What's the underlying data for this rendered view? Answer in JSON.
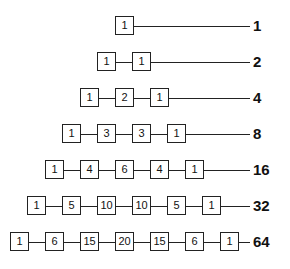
{
  "rows": [
    {
      "values": [
        "1"
      ],
      "sum": "1"
    },
    {
      "values": [
        "1",
        "1"
      ],
      "sum": "2"
    },
    {
      "values": [
        "1",
        "2",
        "1"
      ],
      "sum": "4"
    },
    {
      "values": [
        "1",
        "3",
        "3",
        "1"
      ],
      "sum": "8"
    },
    {
      "values": [
        "1",
        "4",
        "6",
        "4",
        "1"
      ],
      "sum": "16"
    },
    {
      "values": [
        "1",
        "5",
        "10",
        "10",
        "5",
        "1"
      ],
      "sum": "32"
    },
    {
      "values": [
        "1",
        "6",
        "15",
        "20",
        "15",
        "6",
        "1"
      ],
      "sum": "64"
    }
  ]
}
